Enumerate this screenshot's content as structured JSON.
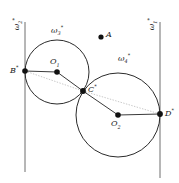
{
  "figure": {
    "width": 179,
    "height": 183,
    "background": "#ffffff",
    "stroke_color": "#2b2b2b",
    "dotted_color": "#c9c9c9",
    "point_color": "#111111"
  },
  "labels": {
    "omega1": "ω",
    "omega1_sub": "1",
    "omega1_sup": "*",
    "omega2": "ω",
    "omega2_sub": "2",
    "omega2_sup": "*",
    "omega3": "ω",
    "omega3_sub": "3",
    "omega3_sup": "*",
    "omega4": "ω",
    "omega4_sub": "4",
    "omega4_sup": "*",
    "point_a": "A",
    "point_b": "B",
    "point_b_sup": "*",
    "point_c": "C",
    "point_c_sup": "*",
    "point_d": "D",
    "point_d_sup": "*",
    "center_o1": "O",
    "center_o1_sub": "1",
    "center_o2": "O",
    "center_o2_sub": "2"
  },
  "geometry": {
    "lines": [
      {
        "name": "omega2-line",
        "x1": 25,
        "y1": 22,
        "x2": 25,
        "y2": 172
      },
      {
        "name": "omega1-line",
        "x1": 160,
        "y1": 22,
        "x2": 160,
        "y2": 178
      }
    ],
    "circles": [
      {
        "name": "omega3-circle",
        "cx": 57,
        "cy": 72,
        "r": 32
      },
      {
        "name": "omega4-circle",
        "cx": 118,
        "cy": 115,
        "r": 42
      }
    ],
    "radii": [
      {
        "name": "radius-b-o1",
        "x1": 25,
        "y1": 71,
        "x2": 57,
        "y2": 72
      },
      {
        "name": "radius-o1-c",
        "x1": 57,
        "y1": 72,
        "x2": 83,
        "y2": 91
      },
      {
        "name": "radius-c-o2",
        "x1": 83,
        "y1": 91,
        "x2": 118,
        "y2": 115
      },
      {
        "name": "radius-o2-d",
        "x1": 118,
        "y1": 115,
        "x2": 160,
        "y2": 114
      }
    ],
    "dotted": [
      {
        "name": "chord-b-c",
        "x1": 25,
        "y1": 71,
        "x2": 83,
        "y2": 91
      },
      {
        "name": "chord-c-d",
        "x1": 83,
        "y1": 91,
        "x2": 160,
        "y2": 114
      }
    ],
    "points": [
      {
        "name": "point-a",
        "cx": 101,
        "cy": 37,
        "r": 2.6
      },
      {
        "name": "point-b",
        "cx": 25,
        "cy": 71,
        "r": 2.8
      },
      {
        "name": "point-o1",
        "cx": 57,
        "cy": 72,
        "r": 2.8
      },
      {
        "name": "point-c",
        "cx": 83,
        "cy": 91,
        "r": 2.9
      },
      {
        "name": "point-o2",
        "cx": 118,
        "cy": 115,
        "r": 2.8
      },
      {
        "name": "point-d",
        "cx": 160,
        "cy": 114,
        "r": 2.9
      }
    ]
  }
}
